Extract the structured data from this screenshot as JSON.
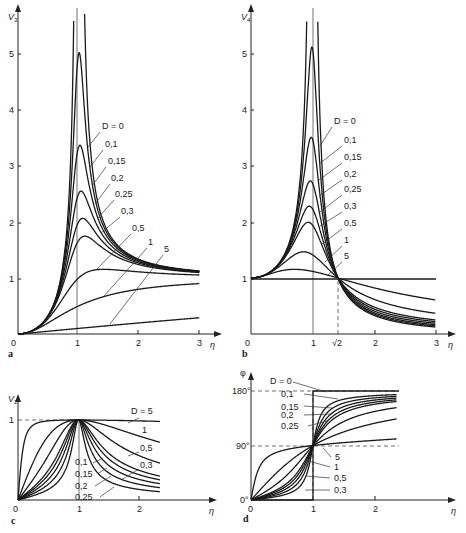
{
  "chart_data": [
    {
      "panel": "a",
      "type": "line",
      "title": "",
      "xlabel": "η",
      "ylabel": "V3",
      "xlim": [
        0,
        3
      ],
      "ylim": [
        0,
        5.5
      ],
      "x_ticks": [
        "0",
        "1",
        "2",
        "3"
      ],
      "y_ticks": [
        "1",
        "2",
        "3",
        "4",
        "5"
      ],
      "legend_title": "D = 0",
      "series_labels": [
        "D = 0",
        "0,1",
        "0,15",
        "0,2",
        "0,25",
        "0,3",
        "0,5",
        "1",
        "5"
      ],
      "peaks": [
        {
          "D": 0,
          "peak": "∞",
          "eta": 1.0
        },
        {
          "D": 0.1,
          "peak": 5.03,
          "eta": 1.0
        },
        {
          "D": 0.15,
          "peak": 3.4,
          "eta": 1.01
        },
        {
          "D": 0.2,
          "peak": 2.55,
          "eta": 1.02
        },
        {
          "D": 0.25,
          "peak": 2.07,
          "eta": 1.03
        },
        {
          "D": 0.3,
          "peak": 1.75,
          "eta": 1.05
        },
        {
          "D": 0.5,
          "peak": 1.15,
          "eta": 1.41
        },
        {
          "D": 1,
          "peak": 0.9,
          "eta": 3.0
        },
        {
          "D": 5,
          "peak": 0.3,
          "eta": 3.0
        }
      ],
      "asymptote_at_eta3": 1.1
    },
    {
      "panel": "b",
      "type": "line",
      "xlabel": "η",
      "ylabel": "V4",
      "xlim": [
        0,
        3
      ],
      "ylim": [
        0,
        5.5
      ],
      "x_ticks": [
        "0",
        "1",
        "√2",
        "2",
        "3"
      ],
      "y_ticks": [
        "1",
        "2",
        "3",
        "4",
        "5"
      ],
      "series_labels": [
        "D = 0",
        "0,1",
        "0,15",
        "0,2",
        "0,25",
        "0,3",
        "0,5",
        "1",
        "5"
      ],
      "crossing_point": {
        "eta": "√2",
        "value": 1
      },
      "peaks": [
        {
          "D": 0,
          "peak": "∞",
          "eta": 1.0
        },
        {
          "D": 0.1,
          "peak": 5.1,
          "eta": 0.99
        },
        {
          "D": 0.15,
          "peak": 3.5,
          "eta": 0.98
        },
        {
          "D": 0.2,
          "peak": 2.75,
          "eta": 0.96
        },
        {
          "D": 0.25,
          "peak": 2.3,
          "eta": 0.94
        },
        {
          "D": 0.3,
          "peak": 2.0,
          "eta": 0.9
        },
        {
          "D": 0.5,
          "peak": 1.5,
          "eta": 0.8
        },
        {
          "D": 1,
          "peak": 1.15,
          "eta": 0.7
        },
        {
          "D": 5,
          "peak": 1.0,
          "eta": 0
        }
      ]
    },
    {
      "panel": "c",
      "type": "line",
      "xlabel": "η",
      "ylabel": "V2",
      "xlim": [
        0,
        2.3
      ],
      "ylim": [
        0,
        1
      ],
      "x_ticks": [
        "0",
        "1",
        "2"
      ],
      "y_ticks": [
        "1"
      ],
      "series_labels": [
        "D = 5",
        "1",
        "0,5",
        "0,3",
        "0,1",
        "0,15",
        "0,2",
        "0,25"
      ],
      "peak": {
        "eta": 1,
        "value": 1
      }
    },
    {
      "panel": "d",
      "type": "line",
      "xlabel": "η",
      "ylabel": "φ",
      "xlim": [
        0,
        2.3
      ],
      "ylim": [
        0,
        180
      ],
      "x_ticks": [
        "0",
        "1",
        "2"
      ],
      "y_ticks": [
        "0°",
        "90°",
        "180°"
      ],
      "series_labels": [
        "D = 0",
        "0,1",
        "0,15",
        "0,2",
        "0,25",
        "5",
        "1",
        "0,5",
        "0,3"
      ],
      "crossing_point": {
        "eta": 1,
        "value": 90
      }
    }
  ],
  "panels": {
    "a": {
      "letter": "a",
      "ylabel": "V",
      "ysub": "3",
      "xlabel": "η",
      "xticks": [
        "0",
        "1",
        "2",
        "3"
      ],
      "yticks": [
        "1",
        "2",
        "3",
        "4",
        "5"
      ],
      "labels": [
        "D = 0",
        "0,1",
        "0,15",
        "0,2",
        "0,25",
        "0,3",
        "0,5",
        "1",
        "5"
      ]
    },
    "b": {
      "letter": "b",
      "ylabel": "V",
      "ysub": "4",
      "xlabel": "η",
      "xticks": [
        "0",
        "1",
        "√2",
        "2",
        "3"
      ],
      "yticks": [
        "1",
        "2",
        "3",
        "4",
        "5"
      ],
      "labels": [
        "D = 0",
        "0,1",
        "0,15",
        "0,2",
        "0,25",
        "0,3",
        "0,5",
        "1",
        "5"
      ]
    },
    "c": {
      "letter": "c",
      "ylabel": "V",
      "ysub": "2",
      "xlabel": "η",
      "xticks": [
        "0",
        "1",
        "2"
      ],
      "yticks": [
        "1"
      ],
      "labels": [
        "D = 5",
        "1",
        "0,5",
        "0,3",
        "0,1",
        "0,15",
        "0,2",
        "0,25"
      ]
    },
    "d": {
      "letter": "d",
      "ylabel": "φ",
      "xlabel": "η",
      "xticks": [
        "0",
        "1",
        "2"
      ],
      "yticks": [
        "0°",
        "90°",
        "180°"
      ],
      "labels": [
        "D = 0",
        "0,1",
        "0,15",
        "0,2",
        "0,25",
        "5",
        "1",
        "0,5",
        "0,3"
      ]
    }
  }
}
